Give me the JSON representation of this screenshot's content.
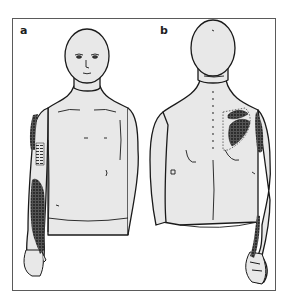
{
  "figure": {
    "panels": [
      {
        "label": "a",
        "view": "anterior"
      },
      {
        "label": "b",
        "view": "posterior"
      }
    ],
    "colors": {
      "skin": "#e8e8e8",
      "outline": "#1a1a1a",
      "shading": "#2a2a2a",
      "frame": "#5a5a5a",
      "background": "#ffffff"
    }
  }
}
